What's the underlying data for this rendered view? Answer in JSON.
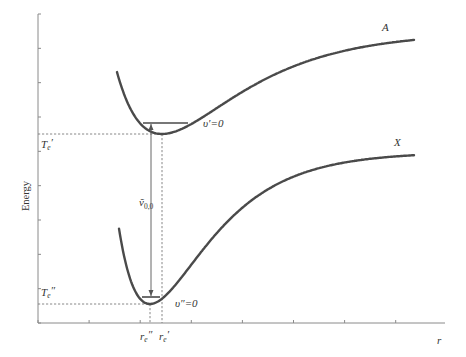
{
  "diagram": {
    "axes": {
      "y_label": "Energy",
      "x_label": "r",
      "y_tick_count": 10,
      "x_tick_count": 8
    },
    "curves": [
      {
        "id": "A",
        "label": "A",
        "state": "excited",
        "level_label": "υ′=0"
      },
      {
        "id": "X",
        "label": "X",
        "state": "ground",
        "level_label": "υ″=0"
      }
    ],
    "transition": {
      "symbol": "ṽ",
      "subscript": "0,0",
      "from": "υ″=0",
      "to": "υ′=0"
    },
    "energy_markers": [
      {
        "id": "Te_prime",
        "base": "T",
        "sub": "e",
        "prime": "′"
      },
      {
        "id": "Te_double_prime",
        "base": "T",
        "sub": "e",
        "prime": "″"
      }
    ],
    "distance_markers": [
      {
        "id": "re_double_prime",
        "base": "r",
        "sub": "e",
        "prime": "″"
      },
      {
        "id": "re_prime",
        "base": "r",
        "sub": "e",
        "prime": "′"
      }
    ],
    "colors": {
      "curve": "#4a4a4a",
      "axis": "#8a8a8a",
      "dashed": "#7a7a7a"
    }
  }
}
